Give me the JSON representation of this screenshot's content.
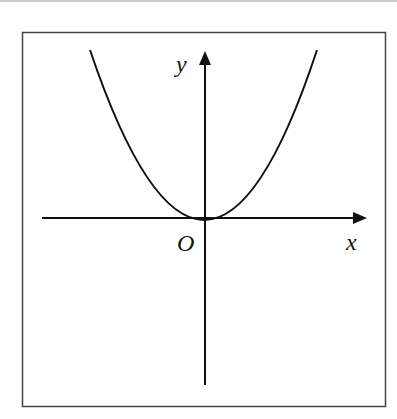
{
  "figure": {
    "x_label": "x",
    "y_label": "y",
    "origin_label": "O",
    "curve": "parabola opening upward, vertex at origin (y = ax^2, a > 0)"
  },
  "colors": {
    "stroke": "#111111",
    "frame": "#444444",
    "background": "#ffffff"
  }
}
